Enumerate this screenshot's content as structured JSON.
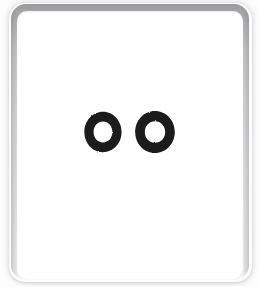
{
  "scene": {
    "description": "Scanned white card with rounded corners on a white background",
    "background_color": "#fdfdfd",
    "width": 260,
    "height": 287
  },
  "card": {
    "name": "white card",
    "face_color": "#ffffff",
    "frame_top_color": "#9b9b9e",
    "frame_bottom_color": "#fafafa",
    "corner_radius": "15px",
    "x": 11,
    "y": 4,
    "width": 238,
    "height": 276
  },
  "mark": {
    "type": "hand-drawn glyphs",
    "reading": "OO",
    "count": 2,
    "ink_color": "#1a1a1a",
    "glyphs": [
      {
        "name": "ring-left",
        "shape": "ring",
        "outer_width": 42,
        "outer_height": 44,
        "stroke_width": 10
      },
      {
        "name": "ring-right",
        "shape": "ring",
        "outer_width": 46,
        "outer_height": 46,
        "stroke_width": 10
      }
    ]
  }
}
